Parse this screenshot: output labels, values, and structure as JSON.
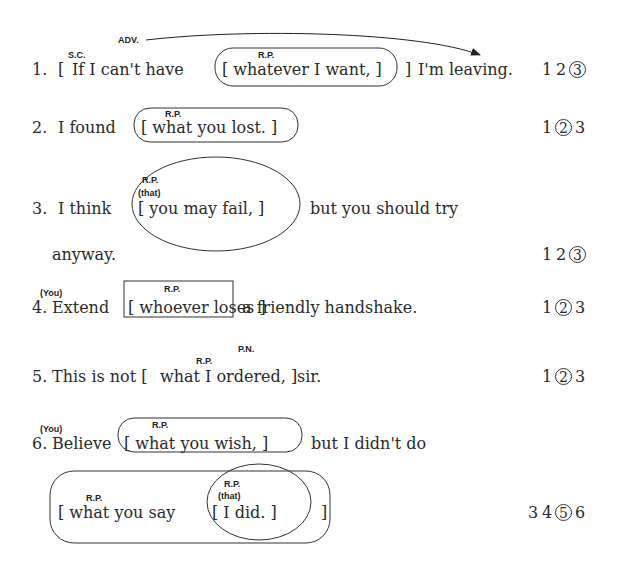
{
  "items": [
    {
      "number": "1.",
      "parts": {
        "open": "[",
        "lead": "If  I  can't  have",
        "clause": "[  whatever  I  want,  ]",
        "close": "]",
        "tail": "I'm  leaving."
      },
      "labels": {
        "sc": "S.C.",
        "adv": "ADV.",
        "rp": "R.P."
      },
      "choices": [
        "1",
        "2",
        "3"
      ],
      "selected": "3"
    },
    {
      "number": "2.",
      "parts": {
        "lead": "I  found",
        "clause": "[  what  you  lost.  ]"
      },
      "labels": {
        "rp": "R.P."
      },
      "choices": [
        "1",
        "2",
        "3"
      ],
      "selected": "2"
    },
    {
      "number": "3.",
      "parts": {
        "lead": "I  think",
        "clause": "[    you   may   fail,  ]",
        "tail": "but  you  should  try",
        "cont": "anyway."
      },
      "labels": {
        "rp": "R.P.",
        "that": "(that)"
      },
      "choices": [
        "1",
        "2",
        "3"
      ],
      "selected": "3"
    },
    {
      "number": "4.",
      "parts": {
        "lead": "Extend",
        "clause": "[  whoever  loses  ]",
        "tail": "a  friendly  handshake."
      },
      "labels": {
        "you": "(You)",
        "rp": "R.P."
      },
      "choices": [
        "1",
        "2",
        "3"
      ],
      "selected": "2"
    },
    {
      "number": "5.",
      "parts": {
        "lead": "This  is  not  [",
        "clause": "what  I  ordered,  ]",
        "tail": "sir."
      },
      "labels": {
        "rp": "R.P.",
        "pn": "P.N."
      },
      "choices": [
        "1",
        "2",
        "3"
      ],
      "selected": "2"
    },
    {
      "number": "6.",
      "parts": {
        "lead": "Believe",
        "clause": "[  what  you  wish,  ]",
        "tail": "but  I  didn't  do",
        "outer": "[  what  you  say",
        "inner": "[  I  did.  ]",
        "outer_close": "]"
      },
      "labels": {
        "you": "(You)",
        "rp1": "R.P.",
        "rp2": "R.P.",
        "rp3": "R.P.",
        "that": "(that)"
      },
      "choices": [
        "3",
        "4",
        "5",
        "6"
      ],
      "selected": "5"
    }
  ]
}
